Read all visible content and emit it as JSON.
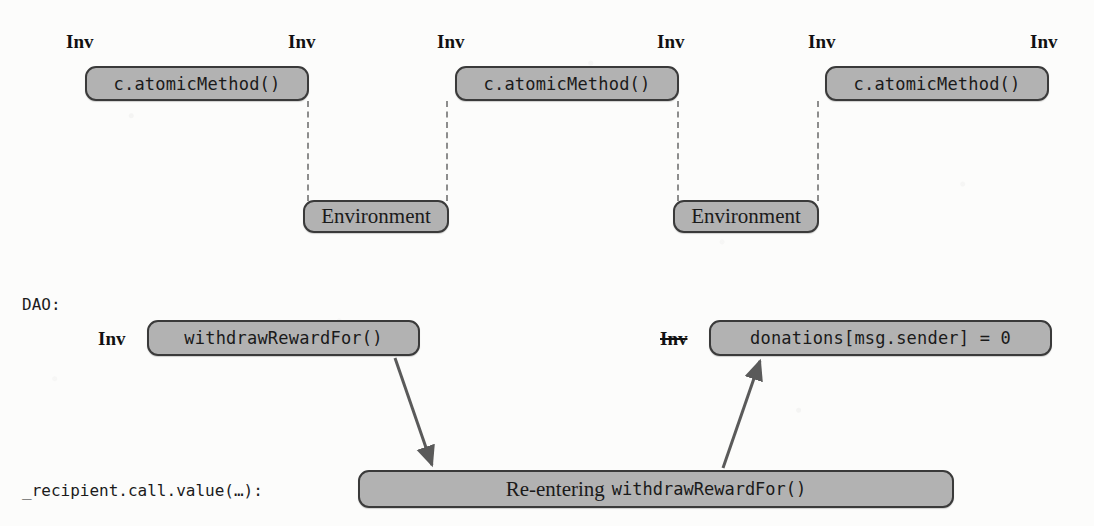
{
  "figure": {
    "background_color": "#fcfcfb",
    "node_fill": "#b2b2b2",
    "node_border": "#3a3a3a",
    "dash_color": "#8d8d8d",
    "arrow_color": "#5a5a5a"
  },
  "labels": {
    "inv": "Inv",
    "inv_struck": "Inv"
  },
  "top_row": {
    "nodes": [
      {
        "text": "c.atomicMethod()"
      },
      {
        "text": "c.atomicMethod()"
      },
      {
        "text": "c.atomicMethod()"
      }
    ],
    "environments": [
      {
        "text": "Environment"
      },
      {
        "text": "Environment"
      }
    ]
  },
  "dao_section": {
    "heading": "DAO:",
    "nodes": [
      {
        "text": "withdrawRewardFor()"
      },
      {
        "text": "donations[msg.sender] = 0"
      }
    ]
  },
  "callback_section": {
    "caption": "_recipient.call.value(…):",
    "node": {
      "prefix": "Re-entering",
      "code": "withdrawRewardFor()"
    }
  }
}
